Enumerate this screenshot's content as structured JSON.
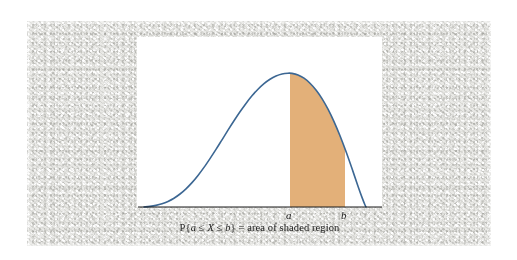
{
  "figure": {
    "caption_prefix": "P{",
    "caption_var_a": "a",
    "caption_le1": " ≤ ",
    "caption_var_X": "X",
    "caption_le2": " ≤ ",
    "caption_var_b": "b",
    "caption_suffix": "} = area of shaded region",
    "caption_full": "P{a ≤ X ≤ b} = area of shaded region",
    "label_a": "a",
    "label_b": "b",
    "panel_background": "#ffffff",
    "backdrop_color": "#e9e9e6"
  },
  "chart_data": {
    "type": "area",
    "title": "",
    "subtitle": "",
    "xlabel": "",
    "ylabel": "",
    "grid": false,
    "legend": null,
    "curve_color": "#3c6793",
    "curve_width": 1.6,
    "axis_color": "#1b1b1b",
    "axis_width": 1.2,
    "shade_color": "#e3b079",
    "xlim": [
      0,
      265
    ],
    "ylim": [
      0,
      190
    ],
    "axis_y_px": 177,
    "axis_x_start_px": 8,
    "axis_x_end_px": 252,
    "shade_region": {
      "a_x_px": 160,
      "b_x_px": 215,
      "a_label": "a",
      "b_label": "b"
    },
    "curve_points_px": [
      [
        14,
        177
      ],
      [
        20,
        176.4
      ],
      [
        26,
        175.4
      ],
      [
        32,
        173.8
      ],
      [
        38,
        171.4
      ],
      [
        44,
        168.2
      ],
      [
        50,
        164.0
      ],
      [
        56,
        158.8
      ],
      [
        62,
        152.6
      ],
      [
        68,
        145.4
      ],
      [
        74,
        137.4
      ],
      [
        80,
        128.6
      ],
      [
        86,
        119.4
      ],
      [
        92,
        109.8
      ],
      [
        98,
        100.2
      ],
      [
        104,
        90.8
      ],
      [
        110,
        81.8
      ],
      [
        116,
        73.4
      ],
      [
        122,
        65.8
      ],
      [
        128,
        59.2
      ],
      [
        134,
        53.6
      ],
      [
        140,
        49.2
      ],
      [
        146,
        46.0
      ],
      [
        152,
        44.0
      ],
      [
        158,
        43.2
      ],
      [
        162,
        43.4
      ],
      [
        168,
        45.0
      ],
      [
        174,
        48.2
      ],
      [
        180,
        53.2
      ],
      [
        186,
        60.0
      ],
      [
        192,
        68.6
      ],
      [
        198,
        79.2
      ],
      [
        204,
        91.6
      ],
      [
        210,
        105.8
      ],
      [
        216,
        121.6
      ],
      [
        222,
        138.6
      ],
      [
        228,
        156.2
      ],
      [
        232,
        167.4
      ],
      [
        235,
        175.0
      ],
      [
        236,
        177
      ]
    ],
    "annotations": [
      {
        "name": "shaded-area-label",
        "text": "P{a ≤ X ≤ b} = area of shaded region",
        "position": "below-axis"
      },
      {
        "name": "tick-a",
        "text": "a",
        "position": "below-axis"
      },
      {
        "name": "tick-b",
        "text": "b",
        "position": "below-axis"
      }
    ]
  }
}
